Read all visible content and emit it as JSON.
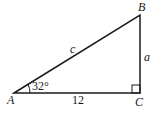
{
  "diagram": {
    "type": "right-triangle",
    "vertices": {
      "A": {
        "label": "A",
        "x": 14,
        "y": 93
      },
      "B": {
        "label": "B",
        "x": 140,
        "y": 15
      },
      "C": {
        "label": "C",
        "x": 140,
        "y": 93
      }
    },
    "angle_A": "32°",
    "sides": {
      "hypotenuse": "c",
      "opposite": "a",
      "adjacent": "12"
    },
    "right_angle_at": "C",
    "stroke_color": "#1a1a1a"
  }
}
